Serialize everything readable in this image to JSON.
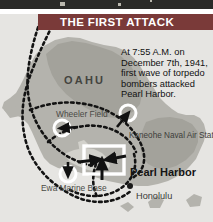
{
  "banner": {
    "title": "THE FIRST ATTACK",
    "background_color": "#7a3a39",
    "text_color": "#ffffff"
  },
  "caption": {
    "text": "At 7:55 A.M. on December 7th, 1941, first wave of torpedo bombers attacked Pearl Harbor."
  },
  "map": {
    "ocean_color": "#e6e5e2",
    "island_color": "#b4b3ad",
    "highland_color": "#a3a29b",
    "route_color": "#1a1a1a",
    "labels": {
      "island": "OAHU",
      "wheeler_field": "Wheeler Field",
      "kaneohe": "Kaneohe Naval Air Station",
      "pearl_harbor": "Pearl Harbor",
      "honolulu": "Honolulu",
      "ewa_base": "Ewa Marine Base"
    },
    "targets": [
      {
        "name": "Wheeler Field",
        "marker": "circle-arrow"
      },
      {
        "name": "Kaneohe Naval Air Station",
        "marker": "circle-arrow"
      },
      {
        "name": "Pearl Harbor",
        "marker": "box-arrows"
      },
      {
        "name": "Ewa Marine Base",
        "marker": "circle-arrow"
      }
    ],
    "city_dot": "Honolulu"
  }
}
